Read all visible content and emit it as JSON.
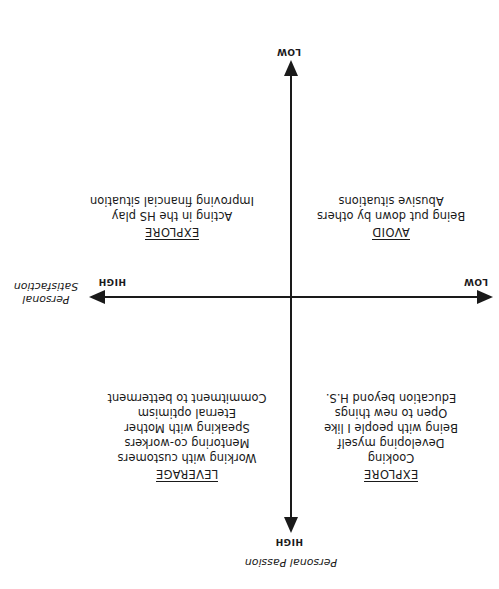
{
  "axes": {
    "vertical": {
      "title": "Personal Passion",
      "high_label": "HIGH",
      "low_label": "LOW"
    },
    "horizontal": {
      "title_line1": "Personal",
      "title_line2": "Satisfaction",
      "high_label": "HIGH",
      "low_label": "LOW"
    }
  },
  "quadrants": {
    "high_passion_low_satisfaction": {
      "heading": "EXPLORE",
      "items": [
        "Cooking",
        "Developing myself",
        "Being with people I like",
        "Open to new things",
        "Education beyond H.S."
      ]
    },
    "high_passion_high_satisfaction": {
      "heading": "LEVERAGE",
      "items": [
        "Working with customers",
        "Mentoring co-workers",
        "Speaking with Mother",
        "Eternal optimism",
        "Commitment to betterment"
      ]
    },
    "low_passion_low_satisfaction": {
      "heading": "AVOID",
      "items": [
        "Being put down by others",
        "Abusive situations"
      ]
    },
    "low_passion_high_satisfaction": {
      "heading": "EXPLORE",
      "items": [
        "Acting in the HS play",
        "Improving financial situation"
      ]
    }
  },
  "display": {
    "orientation": "rotated 180 degrees",
    "line_color": "#1a1a1a",
    "background": "#ffffff"
  }
}
